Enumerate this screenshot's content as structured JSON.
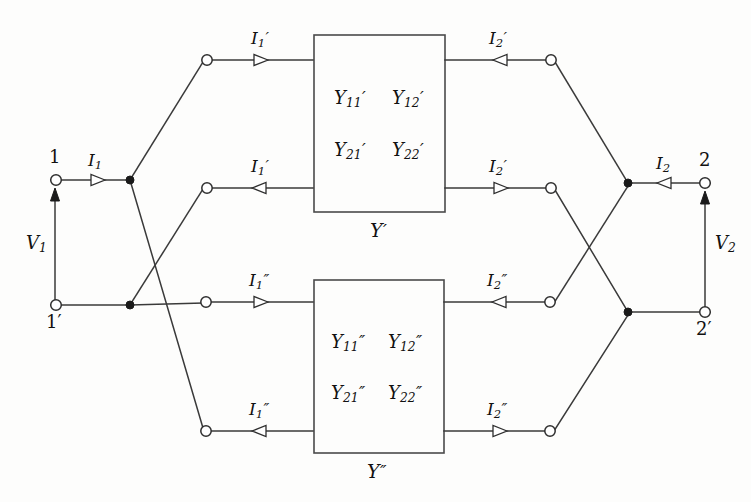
{
  "diagram": {
    "type": "circuit-schematic",
    "colors": {
      "background": "#fdfdfc",
      "wire": "#3a3a3a",
      "node_fill": "#ffffff",
      "text": "#111111"
    }
  },
  "terminals": {
    "in_top": "1",
    "in_bottom": "1′",
    "out_top": "2",
    "out_bottom": "2′"
  },
  "voltages": {
    "v1_symbol": "V",
    "v1_sub": "1",
    "v2_symbol": "V",
    "v2_sub": "2"
  },
  "currents": {
    "i1": {
      "symbol": "I",
      "sub": "1",
      "prime": ""
    },
    "i2": {
      "symbol": "I",
      "sub": "2",
      "prime": ""
    },
    "i1_prime_top": {
      "symbol": "I",
      "sub": "1",
      "prime": "′"
    },
    "i1_prime_bot": {
      "symbol": "I",
      "sub": "1",
      "prime": "′"
    },
    "i2_prime_top": {
      "symbol": "I",
      "sub": "2",
      "prime": "′"
    },
    "i2_prime_bot": {
      "symbol": "I",
      "sub": "2",
      "prime": "′"
    },
    "i1_dprime_top": {
      "symbol": "I",
      "sub": "1",
      "prime": "″"
    },
    "i1_dprime_bot": {
      "symbol": "I",
      "sub": "1",
      "prime": "″"
    },
    "i2_dprime_top": {
      "symbol": "I",
      "sub": "2",
      "prime": "″"
    },
    "i2_dprime_bot": {
      "symbol": "I",
      "sub": "2",
      "prime": "″"
    }
  },
  "network_top": {
    "caption_symbol": "Y",
    "caption_prime": "′",
    "params": [
      {
        "symbol": "Y",
        "sub": "11",
        "prime": "′"
      },
      {
        "symbol": "Y",
        "sub": "12",
        "prime": "′"
      },
      {
        "symbol": "Y",
        "sub": "21",
        "prime": "′"
      },
      {
        "symbol": "Y",
        "sub": "22",
        "prime": "′"
      }
    ]
  },
  "network_bottom": {
    "caption_symbol": "Y",
    "caption_prime": "″",
    "params": [
      {
        "symbol": "Y",
        "sub": "11",
        "prime": "″"
      },
      {
        "symbol": "Y",
        "sub": "12",
        "prime": "″"
      },
      {
        "symbol": "Y",
        "sub": "21",
        "prime": "″"
      },
      {
        "symbol": "Y",
        "sub": "22",
        "prime": "″"
      }
    ]
  }
}
